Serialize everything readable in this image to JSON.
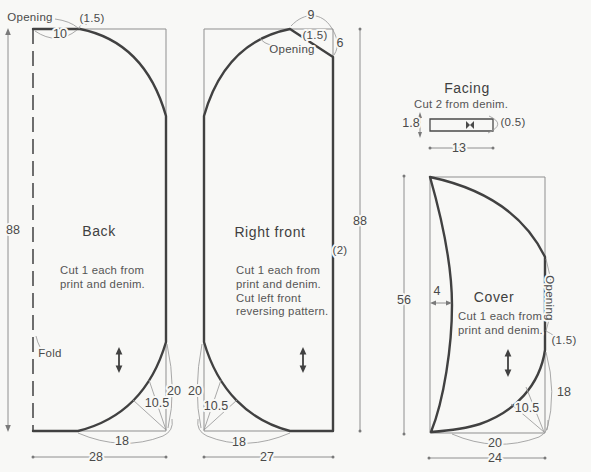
{
  "back": {
    "title": "Back",
    "note1": "Cut 1 each from",
    "note2": "print and denim.",
    "opening_label": "Opening",
    "opening_allowance": "(1.5)",
    "opening_width": "10",
    "height": "88",
    "fold_label": "Fold",
    "curve_height": "20",
    "curve_radius": "10.5",
    "curve_width": "18",
    "width": "28"
  },
  "right_front": {
    "title": "Right front",
    "note1": "Cut 1 each from",
    "note2": "print and denim.",
    "note3": "Cut left front",
    "note4": "reversing pattern.",
    "top_width": "9",
    "opening_allowance": "(1.5)",
    "opening_label": "Opening",
    "side_depth": "6",
    "height": "88",
    "side_allowance": "(2)",
    "curve_height": "20",
    "curve_radius": "10.5",
    "curve_width": "18",
    "width": "27"
  },
  "facing": {
    "title": "Facing",
    "note": "Cut 2 from denim.",
    "height": "1.8",
    "end_allowance": "(0.5)",
    "width": "13"
  },
  "cover": {
    "title": "Cover",
    "note1": "Cut 1 each from",
    "note2": "print and denim.",
    "height": "56",
    "front_inset": "4",
    "opening_label": "Opening",
    "opening_allowance": "(1.5)",
    "curve_height": "18",
    "curve_radius": "10.5",
    "curve_width": "20",
    "width": "24"
  },
  "colors": {
    "ink": "#414141",
    "thin_line": "#8f8f8f",
    "text": "#4a4a4a",
    "background": "#f8f8f6"
  }
}
